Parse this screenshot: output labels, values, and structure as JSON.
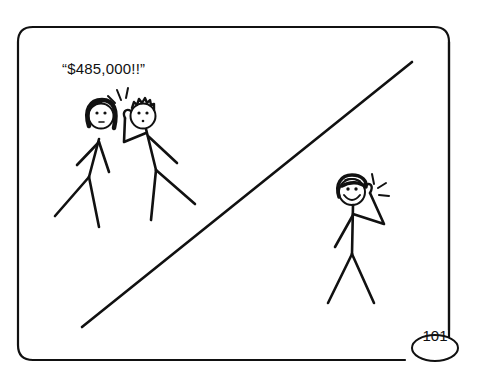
{
  "comic_panel": {
    "speech_text": "“$485,000!!”",
    "page_number": "101",
    "figures": [
      {
        "name": "woman-listening",
        "expression": "neutral"
      },
      {
        "name": "man-listening-to-phone",
        "expression": "surprised"
      },
      {
        "name": "woman-on-phone",
        "expression": "smiling"
      }
    ],
    "colors": {
      "ink": "#111111",
      "background": "#ffffff"
    }
  }
}
